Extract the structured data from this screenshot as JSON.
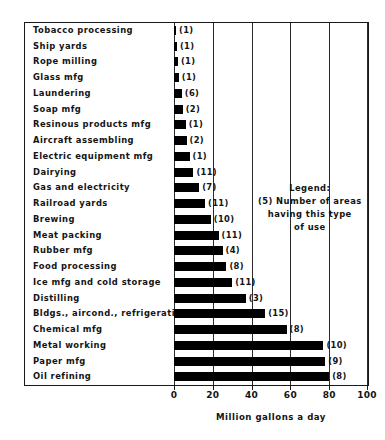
{
  "chart_data": {
    "type": "bar",
    "orientation": "horizontal",
    "title": "",
    "xlabel": "Million gallons a day",
    "ylabel": "",
    "xlim": [
      0,
      100
    ],
    "xticks": [
      0,
      20,
      40,
      60,
      80,
      100
    ],
    "xtick_labels": [
      "0",
      "20",
      "40",
      "60",
      "80",
      "100"
    ],
    "grid": true,
    "grid_axis": "x",
    "bar_color": "#000000",
    "legend_position": "inside-upper-right",
    "categories": [
      "Tobacco processing",
      "Ship yards",
      "Rope milling",
      "Glass mfg",
      "Laundering",
      "Soap mfg",
      "Resinous products mfg",
      "Aircraft assembling",
      "Electric equipment mfg",
      "Dairying",
      "Gas and electricity",
      "Railroad yards",
      "Brewing",
      "Meat packing",
      "Rubber mfg",
      "Food processing",
      "Ice mfg and cold storage",
      "Distilling",
      "Bldgs., aircond., refrigerating",
      "Chemical mfg",
      "Metal working",
      "Paper mfg",
      "Oil refining"
    ],
    "values": [
      1,
      1.5,
      2,
      2.5,
      4,
      4.5,
      6,
      6.5,
      8,
      10,
      13,
      16,
      19,
      23,
      25,
      27,
      30,
      37,
      47,
      58,
      77,
      78,
      80
    ],
    "point_labels": [
      "(1)",
      "(1)",
      "(1)",
      "(1)",
      "(6)",
      "(2)",
      "(1)",
      "(2)",
      "(1)",
      "(11)",
      "(7)",
      "(11)",
      "(10)",
      "(11)",
      "(4)",
      "(8)",
      "(11)",
      "(3)",
      "(15)",
      "(8)",
      "(10)",
      "(9)",
      "(8)"
    ],
    "point_label_meaning": "Number of areas having this type of use",
    "legend": {
      "heading": "Legend:",
      "line1": "(5) Number of areas",
      "line2": "having this type",
      "line3": "of use"
    }
  }
}
